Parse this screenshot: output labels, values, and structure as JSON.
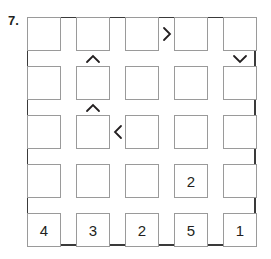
{
  "puzzle": {
    "number_label": "7.",
    "size": 5,
    "grid": [
      [
        "",
        "",
        "",
        "",
        ""
      ],
      [
        "",
        "",
        "",
        "",
        ""
      ],
      [
        "",
        "",
        "",
        "",
        ""
      ],
      [
        "",
        "",
        "",
        "2",
        ""
      ],
      [
        "4",
        "3",
        "2",
        "5",
        "1"
      ]
    ],
    "constraints": [
      {
        "type": "horizontal",
        "row": 1,
        "between_cols": [
          3,
          4
        ],
        "symbol": ">",
        "icon": "greater-than-icon"
      },
      {
        "type": "vertical",
        "col": 2,
        "between_rows": [
          1,
          2
        ],
        "symbol": "∧",
        "icon": "caret-up-icon"
      },
      {
        "type": "vertical",
        "col": 5,
        "between_rows": [
          1,
          2
        ],
        "symbol": "∨",
        "icon": "caret-down-icon"
      },
      {
        "type": "vertical",
        "col": 2,
        "between_rows": [
          2,
          3
        ],
        "symbol": "∧",
        "icon": "caret-up-icon"
      },
      {
        "type": "horizontal",
        "row": 3,
        "between_cols": [
          2,
          3
        ],
        "symbol": "<",
        "icon": "less-than-icon"
      }
    ]
  }
}
